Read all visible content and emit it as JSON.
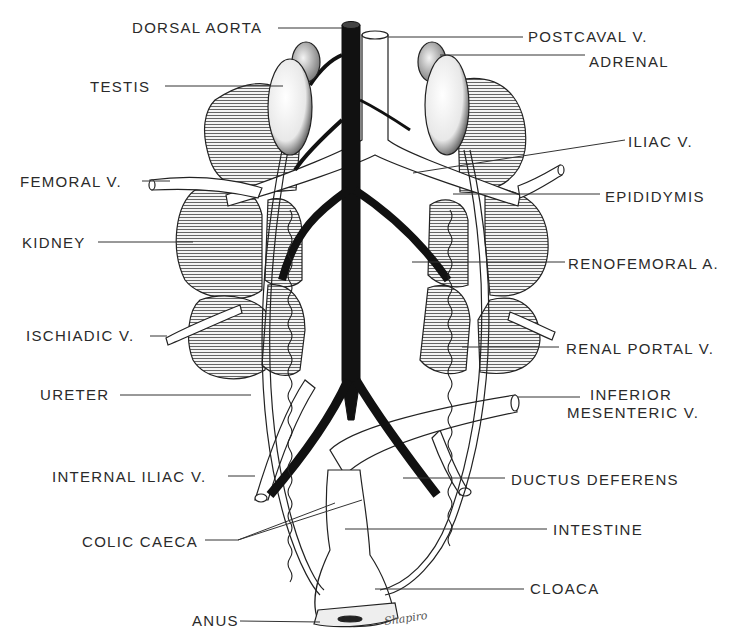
{
  "diagram": {
    "labels_left": [
      {
        "id": "dorsal-aorta",
        "text": "DORSAL AORTA",
        "x": 132,
        "y": 20
      },
      {
        "id": "testis",
        "text": "TESTIS",
        "x": 90,
        "y": 79
      },
      {
        "id": "femoral-v",
        "text": "FEMORAL V.",
        "x": 20,
        "y": 174
      },
      {
        "id": "kidney",
        "text": "KIDNEY",
        "x": 22,
        "y": 235
      },
      {
        "id": "ischiadic-v",
        "text": "ISCHIADIC V.",
        "x": 26,
        "y": 328
      },
      {
        "id": "ureter",
        "text": "URETER",
        "x": 40,
        "y": 387
      },
      {
        "id": "internal-iliac-v",
        "text": "INTERNAL ILIAC V.",
        "x": 52,
        "y": 469
      },
      {
        "id": "colic-caeca",
        "text": "COLIC CAECA",
        "x": 82,
        "y": 534
      },
      {
        "id": "anus",
        "text": "ANUS",
        "x": 192,
        "y": 613
      }
    ],
    "labels_right": [
      {
        "id": "postcaval-v",
        "text": "POSTCAVAL V.",
        "x": 528,
        "y": 29
      },
      {
        "id": "adrenal",
        "text": "ADRENAL",
        "x": 589,
        "y": 54
      },
      {
        "id": "iliac-v",
        "text": "ILIAC V.",
        "x": 628,
        "y": 134
      },
      {
        "id": "epididymis",
        "text": "EPIDIDYMIS",
        "x": 605,
        "y": 189
      },
      {
        "id": "renofemoral-a",
        "text": "RENOFEMORAL A.",
        "x": 568,
        "y": 256
      },
      {
        "id": "renal-portal-v",
        "text": "RENAL PORTAL V.",
        "x": 566,
        "y": 341
      },
      {
        "id": "inferior-mesenteric-v-1",
        "text": "INFERIOR",
        "x": 590,
        "y": 387
      },
      {
        "id": "inferior-mesenteric-v-2",
        "text": "MESENTERIC V.",
        "x": 567,
        "y": 405
      },
      {
        "id": "ductus-deferens",
        "text": "DUCTUS DEFERENS",
        "x": 511,
        "y": 472
      },
      {
        "id": "intestine",
        "text": "INTESTINE",
        "x": 553,
        "y": 522
      },
      {
        "id": "cloaca",
        "text": "CLOACA",
        "x": 530,
        "y": 581
      }
    ],
    "signature": "Shapiro"
  }
}
